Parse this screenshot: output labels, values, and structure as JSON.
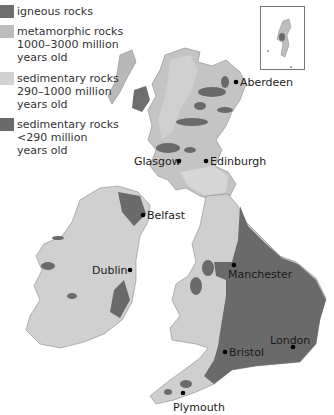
{
  "legend": {
    "items": [
      {
        "label_lines": [
          "igneous rocks"
        ],
        "color": "#6e6e6e"
      },
      {
        "label_lines": [
          "metamorphic rocks",
          "1000–3000 million",
          "years old"
        ],
        "color": "#bdbdbd"
      },
      {
        "label_lines": [
          "sedimentary rocks",
          "290–1000 million",
          "years old"
        ],
        "color": "#d2d2d2"
      },
      {
        "label_lines": [
          "sedimentary rocks",
          "<290 million",
          "years old"
        ],
        "color": "#6a6a6a"
      }
    ]
  },
  "cities": [
    {
      "name": "Aberdeen",
      "x": 236,
      "y": 82
    },
    {
      "name": "Glasgow",
      "x": 179,
      "y": 161
    },
    {
      "name": "Edinburgh",
      "x": 206,
      "y": 161
    },
    {
      "name": "Belfast",
      "x": 143,
      "y": 215
    },
    {
      "name": "Dublin",
      "x": 130,
      "y": 270
    },
    {
      "name": "Manchester",
      "x": 234,
      "y": 265
    },
    {
      "name": "Bristol",
      "x": 225,
      "y": 352
    },
    {
      "name": "London",
      "x": 293,
      "y": 347
    },
    {
      "name": "Plymouth",
      "x": 183,
      "y": 393
    }
  ],
  "inset": {
    "label": "Shetland inset"
  }
}
